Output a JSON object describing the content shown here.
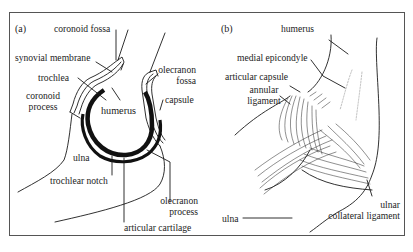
{
  "figure": {
    "panels": [
      {
        "id": "a",
        "tag": "(a)",
        "labels": {
          "coronoid_fossa": "coronoid fossa",
          "synovial_membrane": "synovial membrane",
          "trochlea": "trochlea",
          "coronoid_process_line1": "coronoid",
          "coronoid_process_line2": "process",
          "humerus": "humerus",
          "olecranon_fossa_line1": "olecranon",
          "olecranon_fossa_line2": "fossa",
          "capsule": "capsule",
          "ulna": "ulna",
          "trochlear_notch": "trochlear notch",
          "olecranon_process_line1": "olecranon",
          "olecranon_process_line2": "process",
          "articular_cartilage": "articular cartilage"
        }
      },
      {
        "id": "b",
        "tag": "(b)",
        "labels": {
          "humerus": "humerus",
          "medial_epicondyle": "medial epicondyle",
          "articular_capsule": "articular capsule",
          "annular_ligament_line1": "annular",
          "annular_ligament_line2": "ligament",
          "ulna": "ulna",
          "ulnar_collateral_ligament_line1": "ulnar",
          "ulnar_collateral_ligament_line2": "collateral ligament"
        }
      }
    ],
    "colors": {
      "ink": "#1a1a1a",
      "frame": "#555555",
      "caption": "#9a9a9a"
    }
  }
}
